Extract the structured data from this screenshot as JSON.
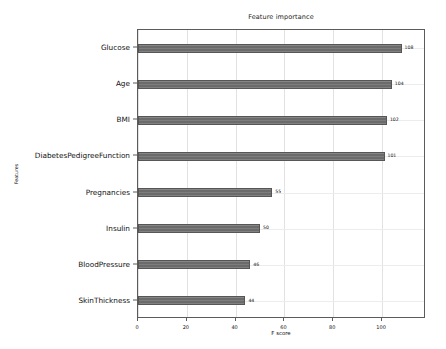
{
  "chart_data": {
    "type": "bar",
    "orientation": "horizontal",
    "title": "Feature importance",
    "xlabel": "F score",
    "ylabel": "Features",
    "categories": [
      "Glucose",
      "Age",
      "BMI",
      "DiabetesPedigreeFunction",
      "Pregnancies",
      "Insulin",
      "BloodPressure",
      "SkinThickness"
    ],
    "values": [
      108,
      104,
      102,
      101,
      55,
      50,
      46,
      44
    ],
    "data_labels": [
      "108",
      "104",
      "102",
      "101",
      "55",
      "50",
      "46",
      "44"
    ],
    "xlim": [
      0,
      118
    ],
    "xticks": [
      0,
      20,
      40,
      60,
      80,
      100
    ],
    "xtick_labels": [
      "0",
      "20",
      "40",
      "60",
      "80",
      "100"
    ],
    "grid": true,
    "legend": false,
    "bar_color": "#6b6b6b",
    "edge_color": "#565656",
    "background": "#ffffff"
  }
}
